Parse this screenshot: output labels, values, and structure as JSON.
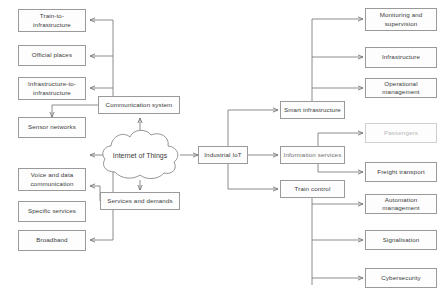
{
  "diagram": {
    "hub": {
      "label": "Internet of Things"
    },
    "colors": {
      "box_border": "#9a9a9a",
      "box_fill": "#fdfdfd",
      "text": "#3b3b3b",
      "faint_text": "#b9b9b9",
      "wire": "#6f6f6f",
      "background": "#ffffff"
    },
    "groups": [
      {
        "name": "communication",
        "parent": {
          "label": "Communication system"
        },
        "children": [
          {
            "label": "Train-to-infrastructure"
          },
          {
            "label": "Official places"
          },
          {
            "label": "Infrastructure-to-infrastructure"
          },
          {
            "label": "Sensor networks"
          }
        ]
      },
      {
        "name": "services",
        "parent": {
          "label": "Services and demands"
        },
        "children": [
          {
            "label": "Voice and data communication"
          },
          {
            "label": "Specific services"
          },
          {
            "label": "Broadband"
          }
        ]
      },
      {
        "name": "industrial",
        "parent": {
          "label": "Industrial IoT"
        },
        "children": [
          {
            "label": "Smart infrastructure"
          },
          {
            "label": "Information services"
          },
          {
            "label": "Train control"
          }
        ]
      },
      {
        "name": "smart-infrastructure",
        "parent": {
          "label": "Smart infrastructure"
        },
        "children": [
          {
            "label": "Monitoring and supervision"
          },
          {
            "label": "Infrastructure"
          },
          {
            "label": "Operational management"
          }
        ]
      },
      {
        "name": "information-services",
        "parent": {
          "label": "Information services"
        },
        "children": [
          {
            "label": "Passengers",
            "style": "faint"
          },
          {
            "label": "Freight transport"
          }
        ]
      },
      {
        "name": "train-control",
        "parent": {
          "label": "Train control"
        },
        "children": [
          {
            "label": "Automation management"
          },
          {
            "label": "Signalisation"
          },
          {
            "label": "Cybersecurity"
          }
        ]
      }
    ],
    "nodes": {
      "train_to_infrastructure": "Train-to-infrastructure",
      "official_places": "Official places",
      "infrastructure_to_infrastructure": "Infrastructure-to-infrastructure",
      "sensor_networks": "Sensor networks",
      "communication_system": "Communication system",
      "voice_and_data": "Voice and data communication",
      "specific_services": "Specific services",
      "broadband": "Broadband",
      "services_and_demands": "Services and demands",
      "internet_of_things": "Internet of Things",
      "industrial_iot": "Industrial IoT",
      "smart_infrastructure": "Smart infrastructure",
      "information_services": "Information services",
      "train_control": "Train control",
      "monitoring_and_supervision": "Monitoring and supervision",
      "infrastructure": "Infrastructure",
      "operational_management": "Operational management",
      "passengers": "Passengers",
      "freight_transport": "Freight transport",
      "automation_management": "Automation management",
      "signalisation": "Signalisation",
      "cybersecurity": "Cybersecurity"
    }
  }
}
